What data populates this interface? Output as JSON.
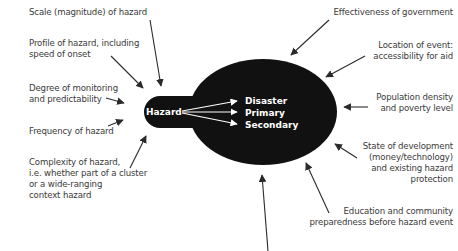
{
  "diagram": {
    "center": {
      "hazard_label": "Hazard",
      "outcomes": [
        "Disaster",
        "Primary",
        "Secondary"
      ],
      "fill_color": "#111111",
      "text_color": "#ffffff"
    },
    "left_factors": [
      {
        "text": "Scale (magnitude) of hazard"
      },
      {
        "text": "Profile of hazard, including\nspeed of onset"
      },
      {
        "text": "Degree of monitoring\nand predictability"
      },
      {
        "text": "Frequency of hazard"
      },
      {
        "text": "Complexity of hazard,\ni.e. whether part of a cluster\nor a wide-ranging\ncontext hazard"
      }
    ],
    "right_factors": [
      {
        "text": "Effectiveness of government"
      },
      {
        "text": "Location of event:\naccessibility for aid"
      },
      {
        "text": "Population density\nand poverty level"
      },
      {
        "text": "State of development\n(money/technology)\nand existing hazard\nprotection"
      },
      {
        "text": "Education and community\npreparedness before hazard event"
      }
    ],
    "arrow_color": "#2a2a2a",
    "label_color": "#3a3a3a"
  }
}
